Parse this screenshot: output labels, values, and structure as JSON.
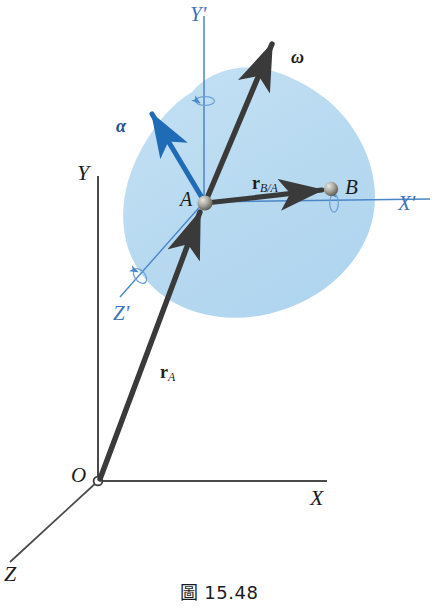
{
  "figure": {
    "caption": "圖 15.48",
    "caption_number": "15.48",
    "caption_prefix": "圖"
  },
  "colors": {
    "body_fill": "#b8daf0",
    "primed_axis": "#4a86c8",
    "alpha_vector": "#1f6bb5",
    "dark_vector": "#3a3a3a",
    "fixed_axis": "#555555",
    "label_text": "#1c1c1c",
    "label_blue": "#3f73b8",
    "sphere_light": "#d8d8d4",
    "sphere_dark": "#5d5d58"
  },
  "labels": {
    "y_prime": "Y'",
    "x_prime": "X'",
    "z_prime": "Z'",
    "y_axis": "Y",
    "x_axis": "X",
    "z_axis": "Z",
    "origin": "O",
    "point_a": "A",
    "point_b": "B",
    "omega": "ω",
    "alpha": "α",
    "r_a_base": "r",
    "r_a_sub": "A",
    "r_ba_base": "r",
    "r_ba_sub": "B/A"
  },
  "elements": {
    "body_name": "rigid-body-outline",
    "sphere_a_name": "point-a-marker",
    "sphere_b_name": "point-b-marker",
    "origin_marker_name": "origin-marker",
    "spin_indicator_y": "rotation-indicator-y-prime",
    "spin_indicator_x": "rotation-indicator-x-prime",
    "spin_indicator_z": "rotation-indicator-z-prime"
  },
  "geometry": {
    "point_A": {
      "x": 204,
      "y": 202
    },
    "point_B": {
      "x": 330,
      "y": 190
    },
    "origin_O": {
      "x": 98,
      "y": 481
    },
    "omega_tip": {
      "x": 272,
      "y": 40
    },
    "alpha_tip": {
      "x": 150,
      "y": 110
    }
  }
}
